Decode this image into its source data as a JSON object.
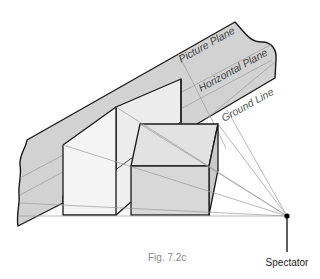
{
  "figure": {
    "caption": "Fig. 7.2c",
    "labels": {
      "picture_plane": "Picture Plane",
      "horizontal_plane": "Horizontal Plane",
      "ground_line": "Ground Line",
      "spectator": "Spectator"
    },
    "colors": {
      "plane_fill": "#d2d2d2",
      "white_box_front": "#f4f4f4",
      "white_box_side": "#ececec",
      "cube_front": "#d8d8d8",
      "cube_top": "#e2e2e2",
      "cube_side": "#cacaca",
      "outline": "#1a1a1a",
      "sight_lines": "#9a9a9a"
    }
  }
}
